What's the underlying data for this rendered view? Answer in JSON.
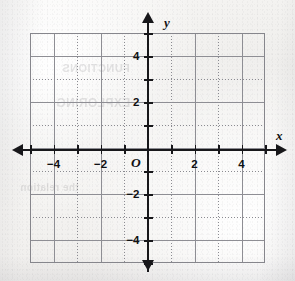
{
  "figure": {
    "kind": "coordinate-plane",
    "origin_label": "O",
    "x_axis_label": "x",
    "y_axis_label": "y"
  },
  "ghost_text": {
    "line1": "FUNCTIONS",
    "line2": "EXPLORING",
    "line3": "the relation"
  },
  "chart_data": {
    "type": "scatter",
    "title": "",
    "subtitle": "",
    "xlabel": "x",
    "ylabel": "y",
    "xlim": [
      -5,
      5
    ],
    "ylim": [
      -5,
      5
    ],
    "grid": true,
    "grid_major_step": 2,
    "grid_minor_step": 1,
    "legend": null,
    "x_ticks": [
      -5,
      -4,
      -3,
      -2,
      -1,
      0,
      1,
      2,
      3,
      4,
      5
    ],
    "y_ticks": [
      -5,
      -4,
      -3,
      -2,
      -1,
      0,
      1,
      2,
      3,
      4,
      5
    ],
    "x_tick_labels": [
      {
        "value": -4,
        "text": "−4"
      },
      {
        "value": -2,
        "text": "−2"
      },
      {
        "value": 2,
        "text": "2"
      },
      {
        "value": 4,
        "text": "4"
      }
    ],
    "y_tick_labels": [
      {
        "value": 4,
        "text": "4"
      },
      {
        "value": 2,
        "text": "2"
      },
      {
        "value": -2,
        "text": "−2"
      },
      {
        "value": -4,
        "text": "−4"
      }
    ],
    "series": [],
    "annotations": [],
    "axis_arrows": {
      "left": "arrow-left",
      "right": "arrow-right",
      "up": "arrow-up",
      "down": "arrow-down"
    }
  }
}
